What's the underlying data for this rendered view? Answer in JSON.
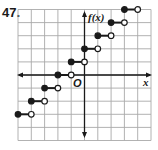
{
  "problem_number": "47.",
  "labels": {
    "y_axis": "f(x)",
    "x_axis": "x",
    "origin": "O"
  },
  "colors": {
    "grid": "#a9a9a9",
    "axis": "#1a1a1a",
    "ink": "#1a1a1a",
    "background": "#ffffff"
  },
  "chart_data": {
    "type": "line",
    "subtype": "step",
    "title": "",
    "xlabel": "x",
    "ylabel": "f(x)",
    "xlim": [
      -5,
      5
    ],
    "ylim": [
      -5,
      5
    ],
    "grid": true,
    "grid_step": 1,
    "legend": null,
    "function": "f(x) = [[x]] + 2",
    "segments": [
      {
        "x_start": -5,
        "x_end": -4,
        "y": -3,
        "start_closed": true,
        "end_closed": false
      },
      {
        "x_start": -4,
        "x_end": -3,
        "y": -2,
        "start_closed": true,
        "end_closed": false
      },
      {
        "x_start": -3,
        "x_end": -2,
        "y": -1,
        "start_closed": true,
        "end_closed": false
      },
      {
        "x_start": -2,
        "x_end": -1,
        "y": 0,
        "start_closed": true,
        "end_closed": false
      },
      {
        "x_start": -1,
        "x_end": 0,
        "y": 1,
        "start_closed": true,
        "end_closed": false
      },
      {
        "x_start": 0,
        "x_end": 1,
        "y": 2,
        "start_closed": true,
        "end_closed": false
      },
      {
        "x_start": 1,
        "x_end": 2,
        "y": 3,
        "start_closed": true,
        "end_closed": false
      },
      {
        "x_start": 2,
        "x_end": 3,
        "y": 4,
        "start_closed": true,
        "end_closed": false
      },
      {
        "x_start": 3,
        "x_end": 4,
        "y": 5,
        "start_closed": true,
        "end_closed": false
      }
    ]
  }
}
